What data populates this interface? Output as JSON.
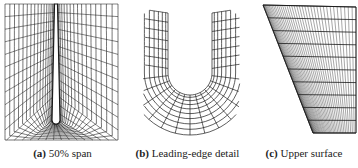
{
  "figure": {
    "panels": [
      {
        "id": "a",
        "label": "(a)",
        "caption": "50% span",
        "description": "C-type mesh around airfoil section at mid-span"
      },
      {
        "id": "b",
        "label": "(b)",
        "caption": "Leading-edge detail",
        "description": "Zoomed mesh around airfoil leading edge"
      },
      {
        "id": "c",
        "label": "(c)",
        "caption": "Upper surface",
        "description": "Surface mesh on wing upper surface planform"
      }
    ],
    "colors": {
      "mesh_line": "#1a1a1a",
      "background": "#ffffff",
      "caption_text": "#222222"
    }
  }
}
